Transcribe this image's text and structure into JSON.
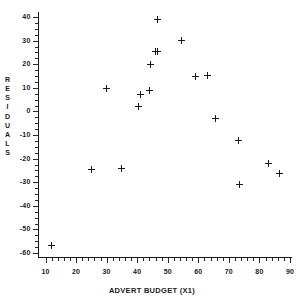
{
  "chart_data": {
    "type": "scatter",
    "title": "",
    "xlabel": "ADVERT BUDGET (X1)",
    "ylabel": "RESIDUALS",
    "xlim": [
      10,
      90
    ],
    "ylim": [
      -60,
      40
    ],
    "grid": false,
    "legend": "none",
    "marker": "plus",
    "marker_color": "#1a1a1a",
    "xticks": [
      10,
      20,
      30,
      40,
      50,
      60,
      70,
      80,
      90
    ],
    "xticklabels": [
      "10",
      "20",
      "30",
      "40",
      "50",
      "60",
      "70",
      "80",
      "90"
    ],
    "x_minor_tick_step": 2,
    "yticks": [
      40,
      30,
      20,
      10,
      0,
      -10,
      -20,
      -30,
      -40,
      -50,
      -60
    ],
    "yticklabels": [
      "40",
      "30",
      "20",
      "10",
      "0",
      "-10",
      "-20",
      "-30",
      "-40",
      "-50",
      "-60"
    ],
    "y_minor_tick_step": 2.5,
    "points": [
      {
        "x": 12.0,
        "y": -57.0
      },
      {
        "x": 25.0,
        "y": -24.5
      },
      {
        "x": 30.0,
        "y": 9.5
      },
      {
        "x": 35.0,
        "y": -24.0
      },
      {
        "x": 40.5,
        "y": 2.0
      },
      {
        "x": 41.0,
        "y": 7.0
      },
      {
        "x": 44.0,
        "y": 9.0
      },
      {
        "x": 44.5,
        "y": 20.0
      },
      {
        "x": 46.0,
        "y": 25.5
      },
      {
        "x": 46.8,
        "y": 25.5
      },
      {
        "x": 46.5,
        "y": 39.0
      },
      {
        "x": 54.5,
        "y": 30.0
      },
      {
        "x": 59.0,
        "y": 15.0
      },
      {
        "x": 63.0,
        "y": 15.3
      },
      {
        "x": 65.5,
        "y": -3.0
      },
      {
        "x": 73.0,
        "y": -12.5
      },
      {
        "x": 73.5,
        "y": -31.0
      },
      {
        "x": 83.0,
        "y": -22.0
      },
      {
        "x": 86.5,
        "y": -26.5
      }
    ],
    "ylabel_letters": [
      "R",
      "E",
      "S",
      "I",
      "D",
      "U",
      "A",
      "L",
      "S"
    ]
  }
}
